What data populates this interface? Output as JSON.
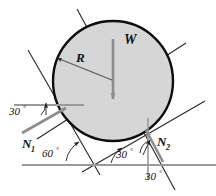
{
  "figure": {
    "background_color": "#ffffff",
    "disk": {
      "name": "cylinder",
      "center_x": 113,
      "center_y": 81,
      "radius": 60,
      "fill_color": "#d6d6d6",
      "stroke_color": "#0d0d0d",
      "stroke_width": 2.4
    },
    "arrow_color": "#8d8d8d",
    "line_color": "#2b2b2b",
    "ground_color": "#9a9a9a",
    "labels": {
      "weight": "W",
      "radius": "R",
      "normal_1": "N",
      "normal_1_sub": "1",
      "normal_2": "N",
      "normal_2_sub": "2"
    },
    "angles": {
      "left_incline": "30",
      "groove_vertex": "60",
      "right_incline": "30",
      "right_normal": "30",
      "degree_symbol": "°"
    },
    "points": {
      "center": {
        "x": 113,
        "y": 81
      },
      "contact_left": {
        "x": 62,
        "y": 110
      },
      "contact_right": {
        "x": 148,
        "y": 133
      },
      "groove_vertex": {
        "x": 94,
        "y": 165
      },
      "ground_y": 165
    }
  }
}
